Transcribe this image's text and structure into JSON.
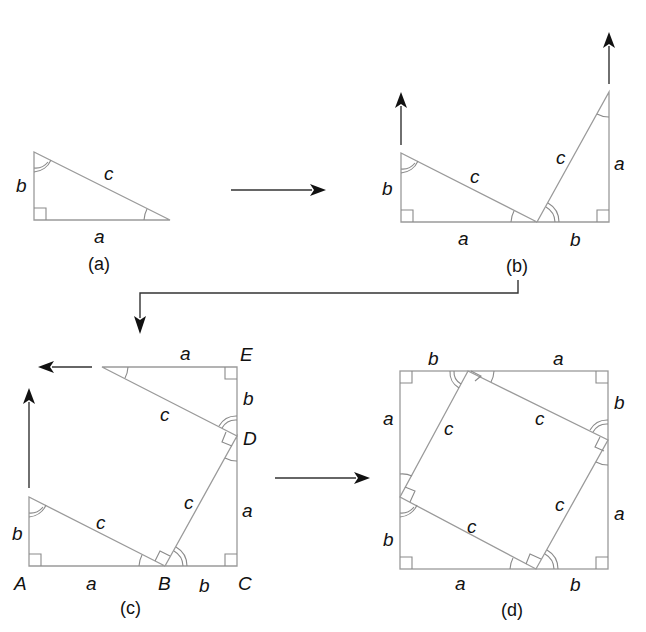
{
  "colors": {
    "edge": "#9a9a9a",
    "arrow": "#111111",
    "text": "#111111",
    "background": "#ffffff"
  },
  "panels": {
    "a": {
      "caption": "(a)",
      "labels": {
        "leg_vertical": "b",
        "hypotenuse": "c",
        "leg_horizontal": "a"
      }
    },
    "b": {
      "caption": "(b)",
      "labels": {
        "left_vertical": "b",
        "left_hyp": "c",
        "left_base": "a",
        "right_hyp": "c",
        "right_vertical": "a",
        "right_base": "b"
      }
    },
    "c": {
      "caption": "(c)",
      "points": {
        "A": "A",
        "B": "B",
        "C": "C",
        "D": "D",
        "E": "E"
      },
      "labels": {
        "top": "a",
        "right_upper": "b",
        "top_hyp": "c",
        "middle_hyp": "c",
        "right_lower": "a",
        "left": "b",
        "bottom_hyp": "c",
        "bottom_left": "a",
        "bottom_right": "b"
      }
    },
    "d": {
      "caption": "(d)",
      "labels": {
        "top_left": "b",
        "top_right": "a",
        "left_upper": "a",
        "left_lower": "b",
        "right_upper": "b",
        "right_lower": "a",
        "bottom_left": "a",
        "bottom_right": "b",
        "inner_top": "c",
        "inner_left": "c",
        "inner_right": "c",
        "inner_bottom": "c"
      }
    }
  },
  "arrows": [
    {
      "name": "a-to-b",
      "direction": "right"
    },
    {
      "name": "b-to-c",
      "direction": "down"
    },
    {
      "name": "c-to-d",
      "direction": "right"
    }
  ]
}
